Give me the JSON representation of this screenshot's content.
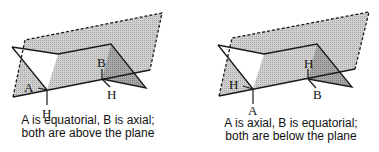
{
  "colors": {
    "plane": "#c9c9c9",
    "chair_shade_light": "#bdbdbd",
    "chair_shade_dark": "#9a9a9a",
    "chair_face_white": "#ffffff",
    "line": "#1a1a1a"
  },
  "left_diagram": {
    "label_a": "A",
    "label_b": "B",
    "label_h_a": "H",
    "label_h_b": "H",
    "caption_line1": "A is equatorial, B is axial;",
    "caption_line2": "both are above the plane"
  },
  "right_diagram": {
    "label_h_a": "H",
    "label_h_b": "H",
    "label_a": "A",
    "label_b": "B",
    "caption_line1": "A is axial, B is equatorial;",
    "caption_line2": "both are below the plane"
  }
}
